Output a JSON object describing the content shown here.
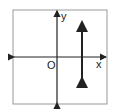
{
  "diagram": {
    "type": "coordinate-plane",
    "labels": {
      "y_axis": "y",
      "x_axis": "x",
      "origin": "O"
    },
    "elements": [
      {
        "kind": "axis",
        "name": "x-axis",
        "double_arrow": true
      },
      {
        "kind": "axis",
        "name": "y-axis",
        "double_arrow": true
      },
      {
        "kind": "line",
        "name": "vertical-line",
        "orientation": "vertical",
        "position": "right of y-axis",
        "double_arrow": true
      }
    ],
    "colors": {
      "frame": "#999999",
      "lines": "#222222"
    }
  }
}
